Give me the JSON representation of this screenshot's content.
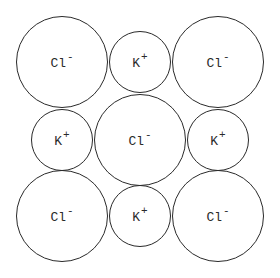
{
  "diagram": {
    "line_color": "#2a2a2a",
    "background": "#ffffff",
    "ions": [
      {
        "id": "r0c0",
        "row": 0,
        "col": 0,
        "symbol": "Cl",
        "charge": "-",
        "type": "anion",
        "cx": 62,
        "cy": 62,
        "r": 46
      },
      {
        "id": "r0c1",
        "row": 0,
        "col": 1,
        "symbol": "K",
        "charge": "+",
        "type": "cation",
        "cx": 140,
        "cy": 62,
        "r": 31
      },
      {
        "id": "r0c2",
        "row": 0,
        "col": 2,
        "symbol": "Cl",
        "charge": "-",
        "type": "anion",
        "cx": 218,
        "cy": 62,
        "r": 46
      },
      {
        "id": "r1c0",
        "row": 1,
        "col": 0,
        "symbol": "K",
        "charge": "+",
        "type": "cation",
        "cx": 62,
        "cy": 140,
        "r": 31
      },
      {
        "id": "r1c1",
        "row": 1,
        "col": 1,
        "symbol": "Cl",
        "charge": "-",
        "type": "anion",
        "cx": 140,
        "cy": 140,
        "r": 46
      },
      {
        "id": "r1c2",
        "row": 1,
        "col": 2,
        "symbol": "K",
        "charge": "+",
        "type": "cation",
        "cx": 218,
        "cy": 140,
        "r": 31
      },
      {
        "id": "r2c0",
        "row": 2,
        "col": 0,
        "symbol": "Cl",
        "charge": "-",
        "type": "anion",
        "cx": 62,
        "cy": 216,
        "r": 46
      },
      {
        "id": "r2c1",
        "row": 2,
        "col": 1,
        "symbol": "K",
        "charge": "+",
        "type": "cation",
        "cx": 140,
        "cy": 216,
        "r": 31
      },
      {
        "id": "r2c2",
        "row": 2,
        "col": 2,
        "symbol": "Cl",
        "charge": "-",
        "type": "anion",
        "cx": 218,
        "cy": 216,
        "r": 46
      }
    ]
  }
}
